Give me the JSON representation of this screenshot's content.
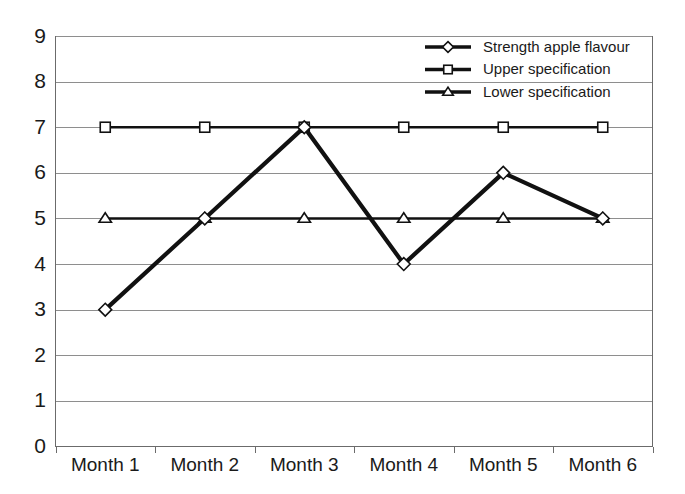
{
  "chart_data": {
    "type": "line",
    "title": "",
    "xlabel": "",
    "ylabel": "",
    "categories": [
      "Month 1",
      "Month 2",
      "Month 3",
      "Month 4",
      "Month 5",
      "Month 6"
    ],
    "ylim": [
      0,
      9
    ],
    "y_ticks": [
      "0",
      "1",
      "2",
      "3",
      "4",
      "5",
      "6",
      "7",
      "8",
      "9"
    ],
    "grid": true,
    "legend_position": "top-right",
    "series": [
      {
        "name": "Strength apple flavour",
        "marker": "diamond",
        "color": "#111111",
        "values": [
          3,
          5,
          7,
          4,
          6,
          5
        ]
      },
      {
        "name": "Upper specification",
        "marker": "square",
        "color": "#111111",
        "values": [
          7,
          7,
          7,
          7,
          7,
          7
        ]
      },
      {
        "name": "Lower specification",
        "marker": "triangle",
        "color": "#111111",
        "values": [
          5,
          5,
          5,
          5,
          5,
          5
        ]
      }
    ]
  },
  "legend": {
    "entries": [
      {
        "label": "Strength apple flavour",
        "icon": "diamond-marker-icon"
      },
      {
        "label": "Upper specification",
        "icon": "square-marker-icon"
      },
      {
        "label": "Lower specification",
        "icon": "triangle-marker-icon"
      }
    ]
  },
  "axes": {
    "y_tick_labels": [
      "9",
      "8",
      "7",
      "6",
      "5",
      "4",
      "3",
      "2",
      "1",
      "0"
    ],
    "x_tick_labels": [
      "Month 1",
      "Month 2",
      "Month 3",
      "Month 4",
      "Month 5",
      "Month 6"
    ]
  },
  "colors": {
    "background": "#ffffff",
    "gridline": "#8e8e8e",
    "axis": "#6b6b6b",
    "series": "#111111",
    "marker_fill": "#ffffff"
  }
}
